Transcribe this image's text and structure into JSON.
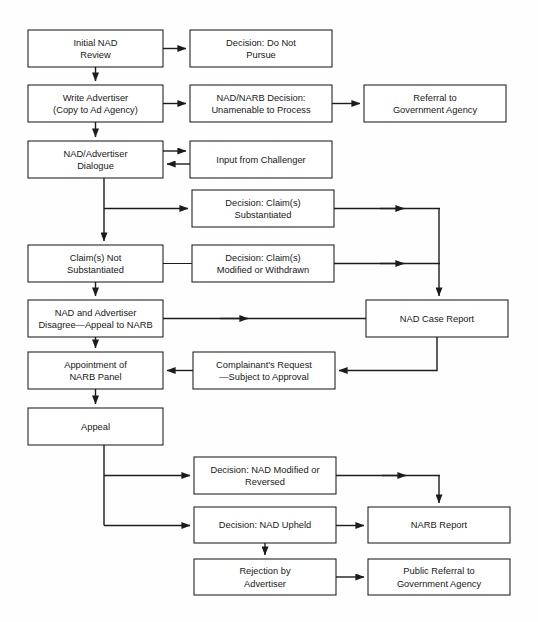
{
  "diagram": {
    "type": "flowchart",
    "background_color": "#fefefe",
    "line_color": "#1c1c1c",
    "box_fill": "#ffffff",
    "nodes": [
      {
        "id": "initial-nad-review",
        "lines": [
          "Initial NAD",
          "Review"
        ],
        "x": 28,
        "y": 30,
        "w": 135,
        "h": 37
      },
      {
        "id": "decision-do-not-pursue",
        "lines": [
          "Decision: Do Not",
          "Pursue"
        ],
        "x": 190,
        "y": 30,
        "w": 142,
        "h": 37
      },
      {
        "id": "write-advertiser",
        "lines": [
          "Write Advertiser",
          "(Copy to Ad Agency)"
        ],
        "x": 28,
        "y": 85,
        "w": 135,
        "h": 37
      },
      {
        "id": "nad-narb-decision",
        "lines": [
          "NAD/NARB Decision:",
          "Unamenable to Process"
        ],
        "x": 190,
        "y": 85,
        "w": 142,
        "h": 37
      },
      {
        "id": "referral-to-government",
        "lines": [
          "Referral to",
          "Government Agency"
        ],
        "x": 364,
        "y": 85,
        "w": 142,
        "h": 37
      },
      {
        "id": "nad-advertiser-dialogue",
        "lines": [
          "NAD/Advertiser",
          "Dialogue"
        ],
        "x": 28,
        "y": 141,
        "w": 135,
        "h": 37
      },
      {
        "id": "input-from-challenger",
        "lines": [
          "Input from Challenger"
        ],
        "x": 190,
        "y": 141,
        "w": 142,
        "h": 37
      },
      {
        "id": "decision-claims-subst",
        "lines": [
          "Decision: Claim(s)",
          "Substantiated"
        ],
        "x": 192,
        "y": 190,
        "w": 142,
        "h": 37
      },
      {
        "id": "claims-not-substantiated",
        "lines": [
          "Claim(s) Not",
          "Substantiated"
        ],
        "x": 28,
        "y": 245,
        "w": 135,
        "h": 37
      },
      {
        "id": "decision-claims-modified",
        "lines": [
          "Decision: Claim(s)",
          "Modified or Withdrawn"
        ],
        "x": 192,
        "y": 245,
        "w": 142,
        "h": 37
      },
      {
        "id": "nad-advertiser-disagree",
        "lines": [
          "NAD and Advertiser",
          "Disagree—Appeal to NARB"
        ],
        "x": 28,
        "y": 300,
        "w": 135,
        "h": 37
      },
      {
        "id": "nad-case-report",
        "lines": [
          "NAD Case Report"
        ],
        "x": 366,
        "y": 300,
        "w": 142,
        "h": 37
      },
      {
        "id": "appointment-narb-panel",
        "lines": [
          "Appointment of",
          "NARB Panel"
        ],
        "x": 28,
        "y": 352,
        "w": 135,
        "h": 37
      },
      {
        "id": "complainants-request",
        "lines": [
          "Complainant's Request",
          "—Subject to Approval"
        ],
        "x": 193,
        "y": 352,
        "w": 142,
        "h": 37
      },
      {
        "id": "appeal",
        "lines": [
          "Appeal"
        ],
        "x": 28,
        "y": 408,
        "w": 135,
        "h": 37
      },
      {
        "id": "decision-nad-modified",
        "lines": [
          "Decision: NAD Modified or",
          "Reversed"
        ],
        "x": 194,
        "y": 457,
        "w": 142,
        "h": 37
      },
      {
        "id": "decision-nad-upheld",
        "lines": [
          "Decision: NAD Upheld"
        ],
        "x": 194,
        "y": 507,
        "w": 142,
        "h": 36
      },
      {
        "id": "narb-report",
        "lines": [
          "NARB Report"
        ],
        "x": 368,
        "y": 507,
        "w": 142,
        "h": 36
      },
      {
        "id": "rejection-by-advertiser",
        "lines": [
          "Rejection by",
          "Advertiser"
        ],
        "x": 194,
        "y": 559,
        "w": 142,
        "h": 36
      },
      {
        "id": "public-referral-government",
        "lines": [
          "Public Referral to",
          "Government Agency"
        ],
        "x": 368,
        "y": 559,
        "w": 142,
        "h": 36
      }
    ],
    "edges": [
      {
        "id": "e-initial-to-donotpursue",
        "from": "initial-nad-review",
        "to": "decision-do-not-pursue"
      },
      {
        "id": "e-initial-to-write",
        "from": "initial-nad-review",
        "to": "write-advertiser"
      },
      {
        "id": "e-write-to-nadnarb",
        "from": "write-advertiser",
        "to": "nad-narb-decision"
      },
      {
        "id": "e-nadnarb-to-referral",
        "from": "nad-narb-decision",
        "to": "referral-to-government"
      },
      {
        "id": "e-write-to-dialogue",
        "from": "write-advertiser",
        "to": "nad-advertiser-dialogue"
      },
      {
        "id": "e-dialogue-to-challenger",
        "from": "nad-advertiser-dialogue",
        "to": "input-from-challenger"
      },
      {
        "id": "e-challenger-to-dialogue",
        "from": "input-from-challenger",
        "to": "nad-advertiser-dialogue"
      },
      {
        "id": "e-dialogue-to-claims-subst",
        "from": "nad-advertiser-dialogue",
        "to": "decision-claims-subst"
      },
      {
        "id": "e-dialogue-to-claims-not",
        "from": "nad-advertiser-dialogue",
        "to": "claims-not-substantiated"
      },
      {
        "id": "e-claims-subst-to-case-report",
        "from": "decision-claims-subst",
        "to": "nad-case-report"
      },
      {
        "id": "e-claims-not-to-modified",
        "from": "claims-not-substantiated",
        "to": "decision-claims-modified"
      },
      {
        "id": "e-modified-to-case-report",
        "from": "decision-claims-modified",
        "to": "nad-case-report"
      },
      {
        "id": "e-claims-not-to-disagree",
        "from": "claims-not-substantiated",
        "to": "nad-advertiser-disagree"
      },
      {
        "id": "e-disagree-to-case-report",
        "from": "nad-advertiser-disagree",
        "to": "nad-case-report"
      },
      {
        "id": "e-disagree-to-appointment",
        "from": "nad-advertiser-disagree",
        "to": "appointment-narb-panel"
      },
      {
        "id": "e-case-report-to-complainant",
        "from": "nad-case-report",
        "to": "complainants-request"
      },
      {
        "id": "e-complainant-to-appointment",
        "from": "complainants-request",
        "to": "appointment-narb-panel"
      },
      {
        "id": "e-appointment-to-appeal",
        "from": "appointment-narb-panel",
        "to": "appeal"
      },
      {
        "id": "e-appeal-to-nad-modified",
        "from": "appeal",
        "to": "decision-nad-modified"
      },
      {
        "id": "e-appeal-to-nad-upheld",
        "from": "appeal",
        "to": "decision-nad-upheld"
      },
      {
        "id": "e-nad-modified-to-narb-report",
        "from": "decision-nad-modified",
        "to": "narb-report"
      },
      {
        "id": "e-nad-upheld-to-narb-report",
        "from": "decision-nad-upheld",
        "to": "narb-report"
      },
      {
        "id": "e-nad-upheld-to-rejection",
        "from": "decision-nad-upheld",
        "to": "rejection-by-advertiser"
      },
      {
        "id": "e-rejection-to-public-referral",
        "from": "rejection-by-advertiser",
        "to": "public-referral-government"
      }
    ]
  }
}
